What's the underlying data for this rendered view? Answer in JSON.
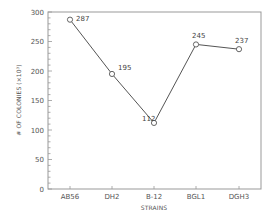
{
  "chart_data": {
    "type": "line",
    "title": "",
    "xlabel": "STRAINS",
    "ylabel": "# OF COLONIES (×10³)",
    "categories": [
      "AB56",
      "DH2",
      "B-12",
      "BGL1",
      "DGH3"
    ],
    "series": [
      {
        "name": "Colonies",
        "values": [
          287,
          195,
          112,
          245,
          237
        ]
      }
    ],
    "data_labels": [
      "287",
      "195",
      "112",
      "245",
      "237"
    ],
    "ylim": [
      0,
      300
    ],
    "yticks": [
      0,
      50,
      100,
      150,
      200,
      250,
      300
    ],
    "ytick_labels": [
      "0",
      "50",
      "100",
      "150",
      "200",
      "250",
      "300"
    ],
    "minor_ytick_step": 10,
    "grid": false,
    "legend": "none",
    "marker": "open-circle",
    "colors": {
      "line": "#555555",
      "axis": "#888888",
      "marker_fill": "#ffffff"
    }
  }
}
